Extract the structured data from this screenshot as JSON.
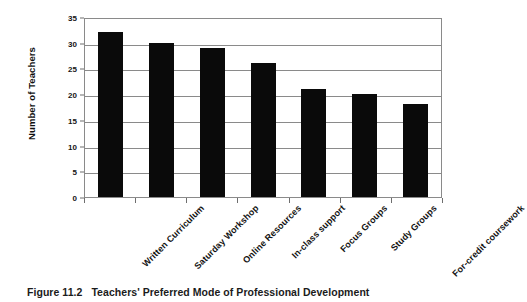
{
  "chart_data": {
    "type": "bar",
    "title": "",
    "categories": [
      "Written Curriculum",
      "Saturday Workshop",
      "Online Resources",
      "In-class support",
      "Focus Groups",
      "Study Groups",
      "For-credit coursework"
    ],
    "values": [
      32,
      30,
      29,
      26,
      21,
      20,
      18
    ],
    "xlabel": "",
    "ylabel": "Number of Teachers",
    "ylim": [
      0,
      35
    ],
    "ytick_labels": [
      "0",
      "5",
      "10",
      "15",
      "20",
      "25",
      "30",
      "35"
    ],
    "ytick_values": [
      0,
      5,
      10,
      15,
      20,
      25,
      30,
      35
    ],
    "ytick_interval": 5,
    "grid": "horizontal",
    "legend": "none",
    "bar_color": "#0a0a0a",
    "gridline_color": "#8a8a8a",
    "xlabel_rotation_deg": 45
  },
  "caption": {
    "number": "Figure 11.2",
    "text": "Teachers' Preferred Mode of Professional Development"
  }
}
